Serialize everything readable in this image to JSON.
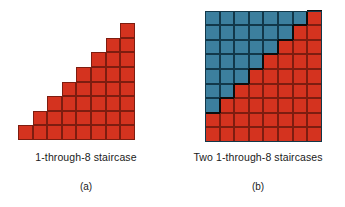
{
  "figure": {
    "panels": [
      {
        "id": "a",
        "caption": "1-through-8 staircase",
        "sublabel": "(a)",
        "type": "staircase",
        "columns": 8,
        "column_heights": [
          1,
          2,
          3,
          4,
          5,
          6,
          7,
          8
        ],
        "cell_fill": "red",
        "total_cells": 36
      },
      {
        "id": "b",
        "caption": "Two 1-through-8 staircases",
        "sublabel": "(b)",
        "type": "rectangle",
        "columns": 8,
        "rows": 9,
        "red_column_heights": [
          2,
          3,
          4,
          5,
          6,
          7,
          8,
          9
        ],
        "blue_column_heights": [
          7,
          6,
          5,
          4,
          3,
          2,
          1,
          0
        ],
        "total_cells": 72
      }
    ]
  },
  "colors": {
    "red_fill": "#d4331f",
    "red_edge": "#7d1d10",
    "blue_fill": "#3c7f9e",
    "blue_edge": "#12384a",
    "divider": "#0d0d0d",
    "background": "#ffffff",
    "text": "#1a1a1a"
  },
  "chart_data": {
    "type": "bar",
    "title": "1-through-8 staircase",
    "xlabel": "",
    "ylabel": "",
    "categories": [
      "1",
      "2",
      "3",
      "4",
      "5",
      "6",
      "7",
      "8"
    ],
    "series": [
      {
        "name": "1-through-8 staircase (red)",
        "values": [
          1,
          2,
          3,
          4,
          5,
          6,
          7,
          8
        ]
      },
      {
        "name": "Second 1-through-8 staircase (blue, inverted)",
        "values": [
          8,
          7,
          6,
          5,
          4,
          3,
          2,
          1
        ]
      }
    ],
    "ylim": [
      0,
      9
    ],
    "grid": true,
    "legend": "none",
    "annotations": [
      "Panel (a): single red staircase of 36 unit squares.",
      "Panel (b): two 1-through-8 staircases interlock to tile an 8 by 9 rectangle of 72 unit squares."
    ]
  }
}
